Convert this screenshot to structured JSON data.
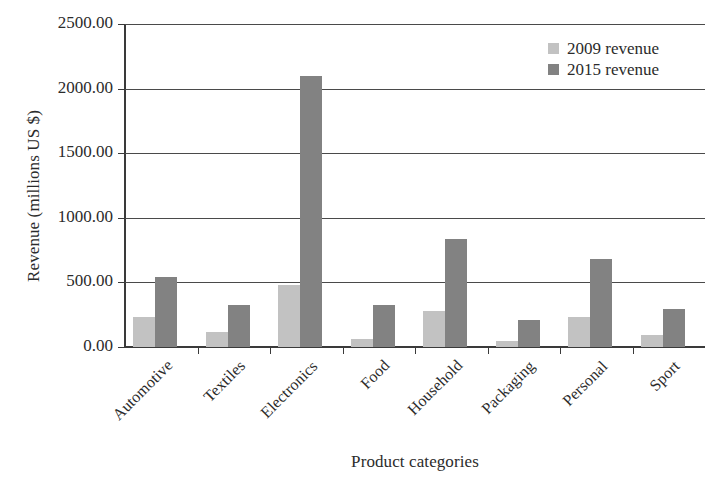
{
  "chart_data": {
    "type": "bar",
    "title": "",
    "xlabel": "Product categories",
    "ylabel": "Revenue (millions US $)",
    "categories": [
      "Automotive",
      "Textiles",
      "Electronics",
      "Food",
      "Household",
      "Packaging",
      "Personal",
      "Sport"
    ],
    "series": [
      {
        "name": "2009 revenue",
        "color": "#c2c2c2",
        "values": [
          235,
          120,
          480,
          65,
          275,
          45,
          235,
          90
        ]
      },
      {
        "name": "2015 revenue",
        "color": "#828282",
        "values": [
          545,
          325,
          2095,
          325,
          835,
          210,
          680,
          295
        ]
      }
    ],
    "ylim": [
      0,
      2500
    ],
    "yticks": [
      0,
      500,
      1000,
      1500,
      2000,
      2500
    ],
    "ytick_labels": [
      "0.00",
      "500.00",
      "1000.00",
      "1500.00",
      "2000.00",
      "2500.00"
    ],
    "grid": "horizontal",
    "legend_position": "top-right",
    "xtick_label_rotation": -45
  },
  "legend": {
    "items": [
      {
        "label": "2009 revenue"
      },
      {
        "label": "2015 revenue"
      }
    ]
  }
}
